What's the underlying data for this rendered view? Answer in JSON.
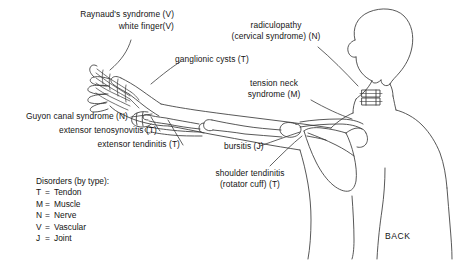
{
  "diagram": {
    "view_label": "BACK",
    "background_color": "#ffffff",
    "line_color": "#3a3a3a",
    "text_color": "#141414"
  },
  "annotations": [
    {
      "id": "raynauds",
      "lines": [
        "Raynaud's syndrome (V)"
      ],
      "type_code": "V",
      "target": "fingertips"
    },
    {
      "id": "white-finger",
      "lines": [
        "white finger(V)"
      ],
      "type_code": "V",
      "target": "fingertips"
    },
    {
      "id": "ganglionic-cysts",
      "lines": [
        "ganglionic cysts (T)"
      ],
      "type_code": "T",
      "target": "wrist-dorsum"
    },
    {
      "id": "guyon-canal",
      "lines": [
        "Guyon canal syndrome (N)"
      ],
      "type_code": "N",
      "target": "wrist-ulnar"
    },
    {
      "id": "extensor-tenosynovitis",
      "lines": [
        "extensor tenosynovitis (T)"
      ],
      "type_code": "T",
      "target": "wrist-extensors"
    },
    {
      "id": "extensor-tendinitis",
      "lines": [
        "extensor tendinitis (T)"
      ],
      "type_code": "T",
      "target": "forearm-extensors"
    },
    {
      "id": "radiculopathy",
      "lines": [
        "radiculopathy",
        "(cervical syndrome) (N)"
      ],
      "type_code": "N",
      "target": "cervical-spine"
    },
    {
      "id": "tension-neck",
      "lines": [
        "tension neck",
        "syndrome (M)"
      ],
      "type_code": "M",
      "target": "neck-shoulder"
    },
    {
      "id": "bursitis",
      "lines": [
        "bursitis (J)"
      ],
      "type_code": "J",
      "target": "shoulder-joint"
    },
    {
      "id": "shoulder-tendinitis",
      "lines": [
        "shoulder tendinitis",
        "(rotator cuff) (T)"
      ],
      "type_code": "T",
      "target": "rotator-cuff"
    }
  ],
  "legend": {
    "title": "Disorders (by type):",
    "entries": [
      {
        "key": "T",
        "eq": "=",
        "label": "Tendon"
      },
      {
        "key": "M",
        "eq": "=",
        "label": "Muscle"
      },
      {
        "key": "N",
        "eq": "=",
        "label": "Nerve"
      },
      {
        "key": "V",
        "eq": "=",
        "label": "Vascular"
      },
      {
        "key": "J",
        "eq": "=",
        "label": "Joint"
      }
    ]
  }
}
